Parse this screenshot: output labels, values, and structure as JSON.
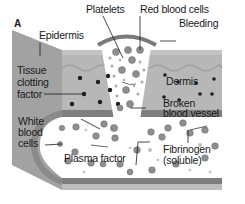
{
  "figure": {
    "panel_letter": "A",
    "labels": {
      "epidermis": "Epidermis",
      "platelets": "Platelets",
      "red_blood_cells": "Red blood cells",
      "bleeding": "Bleeding",
      "tissue_clotting_factor": [
        "Tissue",
        "clotting",
        "factor"
      ],
      "dermis": "Dermis",
      "broken_vessel": [
        "Broken",
        "blood vessel"
      ],
      "white_blood_cells": [
        "White",
        "blood",
        "cells"
      ],
      "plasma_factor": "Plasma factor",
      "fibrinogen": [
        "Fibrinogen",
        "(soluble)"
      ]
    },
    "colors": {
      "epidermis_face": "#9a9a9a",
      "dermis": "#b4b4b4",
      "vessel_wall_dark": "#7a7a7a",
      "vessel_wall_light": "#bdbdbd",
      "vessel_lumen": "#ffffff",
      "dots": "#1e1e1e",
      "cells": "#8a8a8a"
    }
  }
}
